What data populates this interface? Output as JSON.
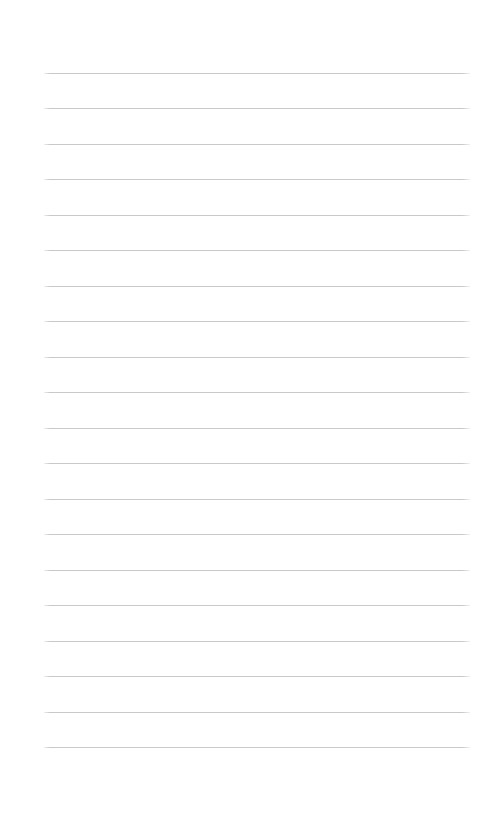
{
  "document": {
    "kind": "ruled-paper-page",
    "title": "Blank ruled notebook page",
    "content_text": "",
    "page_background_color": "#ffffff",
    "rule_line_color": "#c6c6c6",
    "page_width_px": 491,
    "page_height_px": 823
  },
  "ruling": {
    "line_count": 20,
    "first_line_y_px": 73,
    "last_line_y_px": 747,
    "line_spacing_px": 35.5,
    "line_thickness_px": 1,
    "line_left_x_px": 44,
    "line_right_x_px": 470,
    "left_margin_px": 44,
    "right_margin_px": 21,
    "top_margin_px": 73,
    "bottom_margin_px": 76,
    "lines": [
      {
        "index": 1,
        "y": 73,
        "text": ""
      },
      {
        "index": 2,
        "y": 108,
        "text": ""
      },
      {
        "index": 3,
        "y": 144,
        "text": ""
      },
      {
        "index": 4,
        "y": 179,
        "text": ""
      },
      {
        "index": 5,
        "y": 215,
        "text": ""
      },
      {
        "index": 6,
        "y": 250,
        "text": ""
      },
      {
        "index": 7,
        "y": 286,
        "text": ""
      },
      {
        "index": 8,
        "y": 321,
        "text": ""
      },
      {
        "index": 9,
        "y": 357,
        "text": ""
      },
      {
        "index": 10,
        "y": 392,
        "text": ""
      },
      {
        "index": 11,
        "y": 428,
        "text": ""
      },
      {
        "index": 12,
        "y": 463,
        "text": ""
      },
      {
        "index": 13,
        "y": 499,
        "text": ""
      },
      {
        "index": 14,
        "y": 534,
        "text": ""
      },
      {
        "index": 15,
        "y": 570,
        "text": ""
      },
      {
        "index": 16,
        "y": 605,
        "text": ""
      },
      {
        "index": 17,
        "y": 641,
        "text": ""
      },
      {
        "index": 18,
        "y": 676,
        "text": ""
      },
      {
        "index": 19,
        "y": 712,
        "text": ""
      },
      {
        "index": 20,
        "y": 747,
        "text": ""
      }
    ]
  }
}
